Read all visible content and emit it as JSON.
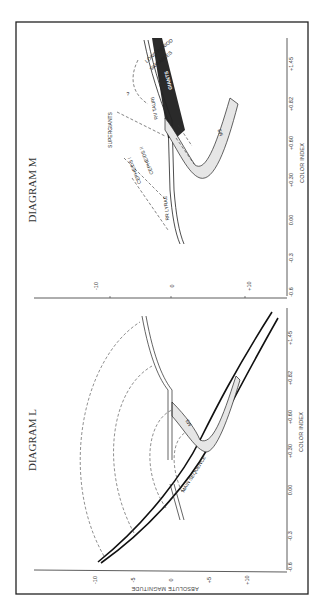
{
  "figure": {
    "orientation": "rotated 90 degrees clockwise",
    "frame_color": "#222222",
    "band_fill": "#e6e6e6",
    "giants_fill": "#2a2a2a"
  },
  "diagram_m": {
    "title": "DIAGRAM M",
    "x_axis": {
      "label": "COLOR INDEX",
      "ticks": [
        "-0.6",
        "-0.3",
        "0.00",
        "+0.30",
        "+0.60",
        "+0.82",
        "+1.45"
      ]
    },
    "y_axis": {
      "ticks": [
        "-10",
        "0",
        "+10"
      ]
    },
    "labels": {
      "long_period": "LONG PERIOD",
      "variables": "VARIABLES",
      "giants": "GIANTS",
      "rv_tauri": "RV TAURI",
      "question": "?",
      "supergiants": "SUPERGIANTS",
      "cepheids_ii": "CEPHEIDS II",
      "cepheids_i": "CEPHEIDS I",
      "rr_lyrae": "RR LYRAE",
      "m3": "M3"
    }
  },
  "diagram_l": {
    "title": "DIAGRAM L",
    "x_axis": {
      "label": "COLOR INDEX",
      "ticks": [
        "-0.6",
        "-0.3",
        "0.00",
        "+0.30",
        "+0.60",
        "+0.82",
        "+1.45"
      ]
    },
    "y_axis": {
      "label": "ABSOLUTE   MAGNITUDE",
      "ticks": [
        "-10",
        "-5",
        "0",
        "+5",
        "+10"
      ]
    },
    "labels": {
      "main_sequence": "MAIN SEQUENCE",
      "m3": "M3"
    }
  }
}
